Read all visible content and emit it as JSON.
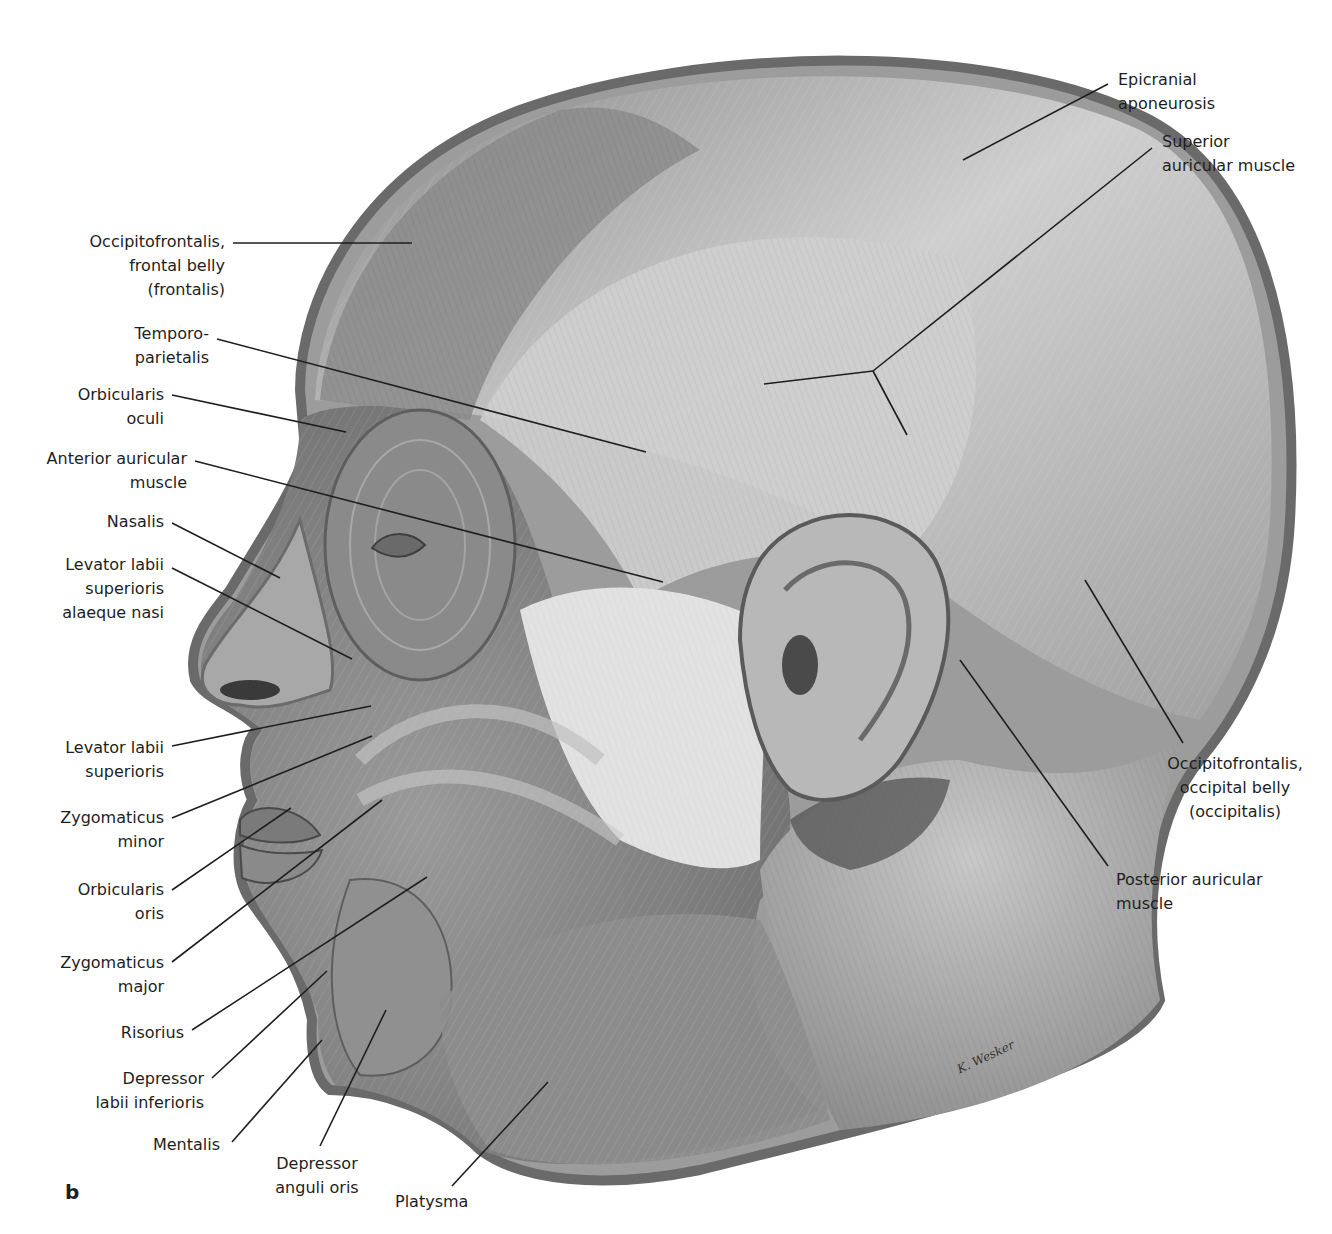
{
  "figure": {
    "panel_letter": "b",
    "signature": "K. Wesker",
    "colors": {
      "background": "#ffffff",
      "text": "#1e1e1e",
      "leader": "#1e1e1e",
      "skin_dark": "#6f6f6f",
      "skin_mid": "#a8a8a8",
      "skin_light": "#d9d9d9",
      "parotid": "#e4e4e4"
    }
  },
  "labels": {
    "epicranial_aponeurosis": "Epicranial\naponeurosis",
    "superior_auricular_muscle": "Superior\nauricular muscle",
    "occipitofrontalis_frontal": "Occipitofrontalis,\nfrontal belly\n(frontalis)",
    "temporoparietalis": "Temporo-\nparietalis",
    "orbicularis_oculi": "Orbicularis\noculi",
    "anterior_auricular_muscle": "Anterior auricular\nmuscle",
    "nasalis": "Nasalis",
    "levator_labii_sup_alaeque_nasi": "Levator labii\nsuperioris\nalaeque nasi",
    "levator_labii_superioris": "Levator labii\nsuperioris",
    "zygomaticus_minor": "Zygomaticus\nminor",
    "orbicularis_oris": "Orbicularis\noris",
    "zygomaticus_major": "Zygomaticus\nmajor",
    "risorius": "Risorius",
    "depressor_labii_inferioris": "Depressor\nlabii inferioris",
    "mentalis": "Mentalis",
    "depressor_anguli_oris": "Depressor\nanguli oris",
    "platysma": "Platysma",
    "occipitofrontalis_occipital": "Occipitofrontalis,\noccipital belly\n(occipitalis)",
    "posterior_auricular_muscle": "Posterior auricular\nmuscle"
  }
}
